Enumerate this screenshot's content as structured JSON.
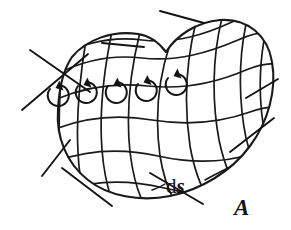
{
  "figure": {
    "name": "surface-integral-vector-field-diagram",
    "background_color": "#ffffff",
    "ink_color": "#1a1a1a",
    "labels": {
      "element_area": {
        "text": "ds",
        "d_part": "d",
        "s_part": "s",
        "meaning": "differential surface element"
      },
      "vector_field": {
        "text": "A",
        "meaning": "vector field A"
      }
    },
    "counts": {
      "curl_loops": 5,
      "normal_arrows": 9,
      "grid_u_lines": 10,
      "grid_v_lines": 6
    },
    "normal_arrows": [
      {
        "name": "arrow-top-left-outer",
        "direction": "up-left"
      },
      {
        "name": "arrow-top-left-inner",
        "direction": "down-left"
      },
      {
        "name": "arrow-top-middle",
        "direction": "left"
      },
      {
        "name": "arrow-top-right",
        "direction": "up-left"
      },
      {
        "name": "arrow-right-upper",
        "direction": "up-right"
      },
      {
        "name": "arrow-right-lower",
        "direction": "up-right"
      },
      {
        "name": "arrow-bottom-left",
        "direction": "down"
      },
      {
        "name": "arrow-bottom-center",
        "direction": "down-right"
      },
      {
        "name": "arrow-bottom-right",
        "direction": "down-right"
      }
    ],
    "curl_loops": [
      {
        "name": "curl-loop-1",
        "rotation": "counterclockwise"
      },
      {
        "name": "curl-loop-2",
        "rotation": "counterclockwise"
      },
      {
        "name": "curl-loop-3",
        "rotation": "counterclockwise"
      },
      {
        "name": "curl-loop-4",
        "rotation": "counterclockwise"
      },
      {
        "name": "curl-loop-5",
        "rotation": "counterclockwise"
      }
    ]
  }
}
